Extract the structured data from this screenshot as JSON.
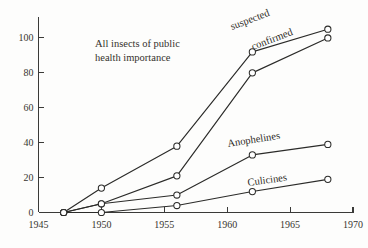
{
  "chart_data": {
    "type": "line",
    "title": "",
    "annotation": {
      "line1": "All insects of public",
      "line2": "health  importance"
    },
    "xlabel": "",
    "ylabel": "",
    "xlim": [
      1945,
      1970
    ],
    "ylim": [
      0,
      100
    ],
    "xticks": [
      1945,
      1950,
      1955,
      1960,
      1965,
      1970
    ],
    "xtick_labels": [
      "1945",
      "1950",
      "1955",
      "1960",
      "1965",
      "1970"
    ],
    "yticks": [
      0,
      20,
      40,
      60,
      80,
      100
    ],
    "ytick_labels": [
      "0",
      "20",
      "40",
      "60",
      "80",
      "100"
    ],
    "grid": false,
    "legend_position": "inline-labels",
    "series": [
      {
        "name": "suspected",
        "label": "suspected",
        "x": [
          1947,
          1950,
          1956,
          1962,
          1968
        ],
        "values": [
          0,
          14,
          38,
          92,
          105
        ]
      },
      {
        "name": "confirmed",
        "label": "confirmed",
        "x": [
          1947,
          1950,
          1956,
          1962,
          1968
        ],
        "values": [
          0,
          5,
          21,
          80,
          100
        ]
      },
      {
        "name": "Anophelines",
        "label": "Anophelines",
        "x": [
          1947,
          1950,
          1956,
          1962,
          1968
        ],
        "values": [
          0,
          5,
          10,
          33,
          39
        ]
      },
      {
        "name": "Culicines",
        "label": "Culicines",
        "x": [
          1947,
          1950,
          1956,
          1962,
          1968
        ],
        "values": [
          0,
          0,
          4,
          12,
          19
        ]
      }
    ]
  },
  "labels": {
    "suspected": "suspected",
    "confirmed": "confirmed",
    "anophelines": "Anophelines",
    "culicines": "Culicines"
  },
  "colors": {
    "ink": "#2b2b29",
    "axis": "#3a3a38",
    "background": "#fdfdfc"
  }
}
